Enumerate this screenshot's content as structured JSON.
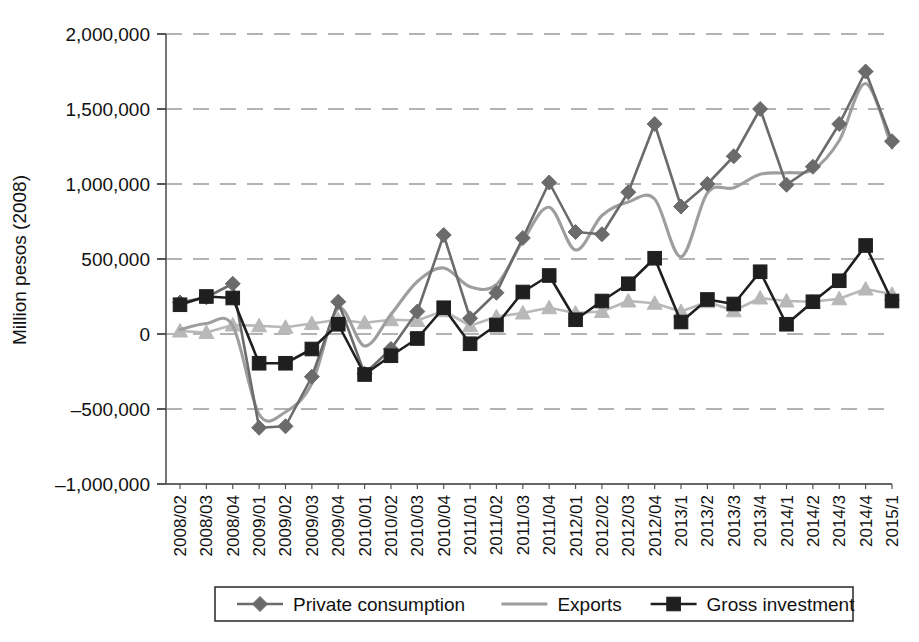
{
  "chart_data": {
    "type": "line",
    "title": "",
    "xlabel": "",
    "ylabel": "Million pesos (2008)",
    "ylim": [
      -1000000,
      2000000
    ],
    "yticks": [
      -1000000,
      -500000,
      0,
      500000,
      1000000,
      1500000,
      2000000
    ],
    "ytick_labels": [
      "–1,000,000",
      "–500,000",
      "0",
      "500,000",
      "1,000,000",
      "1,500,000",
      "2,000,000"
    ],
    "grid": "horizontal-dashed",
    "legend_position": "bottom",
    "categories": [
      "2008/02",
      "2008/03",
      "2008/04",
      "2009/01",
      "2009/02",
      "2009/03",
      "2009/04",
      "2010/01",
      "2010/02",
      "2010/03",
      "2010/04",
      "2011/01",
      "2011/02",
      "2011/03",
      "2011/04",
      "2012/01",
      "2012/02",
      "2012/03",
      "2012/04",
      "2013/1",
      "2013/2",
      "2013/3",
      "2013/4",
      "2014/1",
      "2014/2",
      "2014/3",
      "2014/4",
      "2015/1"
    ],
    "series": [
      {
        "name": "Private consumption",
        "marker": "diamond",
        "color": "#6b6b6b",
        "in_legend": true,
        "values": [
          210000,
          245000,
          335000,
          -625000,
          -615000,
          -285000,
          215000,
          -265000,
          -100000,
          150000,
          660000,
          105000,
          275000,
          640000,
          1010000,
          680000,
          665000,
          945000,
          1400000,
          850000,
          1000000,
          1185000,
          1500000,
          995000,
          1115000,
          1400000,
          1750000,
          1285000
        ]
      },
      {
        "name": "Exports",
        "marker": "none",
        "color": "#9e9e9e",
        "in_legend": true,
        "values": [
          30000,
          70000,
          55000,
          -535000,
          -520000,
          -330000,
          170000,
          -80000,
          130000,
          350000,
          440000,
          315000,
          330000,
          620000,
          845000,
          560000,
          790000,
          880000,
          900000,
          515000,
          940000,
          975000,
          1065000,
          1075000,
          1095000,
          1290000,
          1670000,
          1240000
        ]
      },
      {
        "name": "Gross investment",
        "marker": "square",
        "color": "#1f1f1f",
        "in_legend": true,
        "values": [
          195000,
          250000,
          240000,
          -195000,
          -195000,
          -100000,
          65000,
          -270000,
          -145000,
          -30000,
          175000,
          -65000,
          60000,
          280000,
          390000,
          95000,
          220000,
          335000,
          505000,
          80000,
          230000,
          200000,
          415000,
          65000,
          215000,
          355000,
          590000,
          220000
        ]
      },
      {
        "name": "",
        "marker": "triangle",
        "color": "#b8b8b8",
        "in_legend": false,
        "values": [
          20000,
          10000,
          60000,
          55000,
          45000,
          70000,
          95000,
          75000,
          95000,
          90000,
          155000,
          55000,
          115000,
          140000,
          175000,
          140000,
          150000,
          220000,
          205000,
          150000,
          215000,
          155000,
          240000,
          220000,
          215000,
          235000,
          300000,
          265000
        ]
      }
    ],
    "legend_entries": [
      {
        "label": "Private consumption",
        "marker": "diamond",
        "color": "#6b6b6b"
      },
      {
        "label": "Exports",
        "marker": "none",
        "color": "#9e9e9e"
      },
      {
        "label": "Gross investment",
        "marker": "square",
        "color": "#1f1f1f"
      }
    ]
  }
}
